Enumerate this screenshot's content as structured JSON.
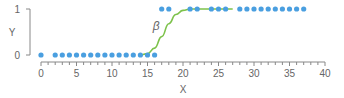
{
  "chart_data": {
    "type": "scatter",
    "title": "",
    "xlabel": "X",
    "ylabel": "Y",
    "xlim": [
      0,
      40
    ],
    "ylim": [
      0,
      1
    ],
    "x_ticks": [
      0,
      5,
      10,
      15,
      20,
      25,
      30,
      35,
      40
    ],
    "x_tick_labels": [
      "0",
      "5",
      "10",
      "15",
      "20",
      "25",
      "30",
      "35",
      "40"
    ],
    "x_minor_tick_step": 1,
    "y_ticks": [
      0,
      1
    ],
    "y_tick_labels": [
      "0",
      "1"
    ],
    "grid": false,
    "legend": null,
    "series": [
      {
        "name": "observations",
        "kind": "scatter",
        "color": "#4a9fe0",
        "points": [
          [
            0,
            0
          ],
          [
            2,
            0
          ],
          [
            3,
            0
          ],
          [
            4,
            0
          ],
          [
            5,
            0
          ],
          [
            6,
            0
          ],
          [
            7,
            0
          ],
          [
            8,
            0
          ],
          [
            9,
            0
          ],
          [
            10,
            0
          ],
          [
            11,
            0
          ],
          [
            12,
            0
          ],
          [
            13,
            0
          ],
          [
            14,
            0
          ],
          [
            15,
            0
          ],
          [
            16,
            0
          ],
          [
            17,
            1
          ],
          [
            18,
            1
          ],
          [
            21,
            1
          ],
          [
            22,
            1
          ],
          [
            24,
            1
          ],
          [
            25,
            1
          ],
          [
            26,
            1
          ],
          [
            28,
            1
          ],
          [
            29,
            1
          ],
          [
            30,
            1
          ],
          [
            31,
            1
          ],
          [
            32,
            1
          ],
          [
            33,
            1
          ],
          [
            34,
            1
          ],
          [
            35,
            1
          ],
          [
            36,
            1
          ],
          [
            37,
            1
          ]
        ]
      },
      {
        "name": "logistic fit",
        "kind": "line",
        "color": "#7dc24b",
        "points": [
          [
            14,
            0
          ],
          [
            15,
            0.03
          ],
          [
            16,
            0.15
          ],
          [
            17,
            0.4
          ],
          [
            18,
            0.68
          ],
          [
            19,
            0.88
          ],
          [
            20,
            0.97
          ],
          [
            21,
            1
          ],
          [
            27,
            1
          ]
        ]
      }
    ],
    "annotations": [
      {
        "text": "β",
        "x": 16.3,
        "y": 0.62
      }
    ]
  },
  "labels": {
    "x_axis": "X",
    "y_axis": "Y",
    "beta": "β"
  }
}
